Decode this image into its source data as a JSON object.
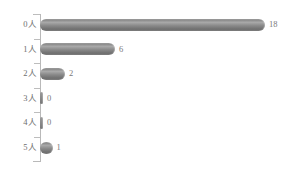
{
  "chart_data": {
    "type": "bar",
    "orientation": "horizontal",
    "title": "",
    "subtitle": "",
    "xlabel": "",
    "ylabel": "",
    "categories": [
      "0人",
      "1人",
      "2人",
      "3人",
      "4人",
      "5人"
    ],
    "values": [
      18,
      6,
      2,
      0,
      0,
      1
    ],
    "value_labels": [
      "18",
      "6",
      "2",
      "0",
      "0",
      "1"
    ],
    "xlim": [
      0,
      18
    ],
    "grid": false,
    "legend": false,
    "series": [
      {
        "name": "",
        "values": [
          18,
          6,
          2,
          0,
          0,
          1
        ]
      }
    ],
    "colors": {
      "bar": "#8a8a8a",
      "bar_highlight": "#a9a9a9",
      "bar_shadow": "#6f6f6f",
      "axis": "#b9b9b9",
      "label_text": "#6e6e6e",
      "value_text": "#7a7a7a",
      "background": "#ffffff"
    }
  },
  "rows": [
    {
      "category": "0人",
      "value": 18,
      "label": "18"
    },
    {
      "category": "1人",
      "value": 6,
      "label": "6"
    },
    {
      "category": "2人",
      "value": 2,
      "label": "2"
    },
    {
      "category": "3人",
      "value": 0,
      "label": "0"
    },
    {
      "category": "4人",
      "value": 0,
      "label": "0"
    },
    {
      "category": "5人",
      "value": 1,
      "label": "1"
    }
  ]
}
